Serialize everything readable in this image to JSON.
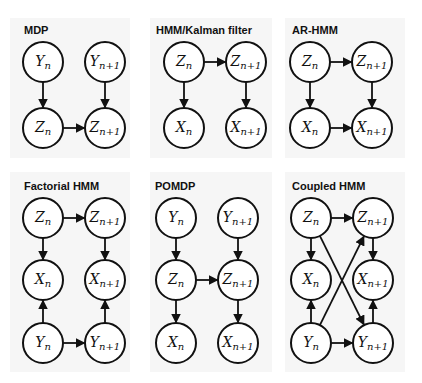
{
  "figure": {
    "panels": [
      {
        "title": "MDP",
        "nodes": [
          {
            "id": "Yn",
            "base": "Y",
            "sub": "n",
            "x": 43,
            "y": 62
          },
          {
            "id": "Yn1",
            "base": "Y",
            "sub": "n+1",
            "x": 105,
            "y": 62
          },
          {
            "id": "Zn",
            "base": "Z",
            "sub": "n",
            "x": 43,
            "y": 128
          },
          {
            "id": "Zn1",
            "base": "Z",
            "sub": "n+1",
            "x": 105,
            "y": 128
          }
        ],
        "edges": [
          [
            "Yn",
            "Zn"
          ],
          [
            "Yn1",
            "Zn1"
          ],
          [
            "Zn",
            "Zn1"
          ]
        ]
      },
      {
        "title": "HMM/Kalman filter",
        "nodes": [
          {
            "id": "Zn",
            "base": "Z",
            "sub": "n",
            "x": 184,
            "y": 62
          },
          {
            "id": "Zn1",
            "base": "Z",
            "sub": "n+1",
            "x": 246,
            "y": 62
          },
          {
            "id": "Xn",
            "base": "X",
            "sub": "n",
            "x": 184,
            "y": 128
          },
          {
            "id": "Xn1",
            "base": "X",
            "sub": "n+1",
            "x": 246,
            "y": 128
          }
        ],
        "edges": [
          [
            "Zn",
            "Zn1"
          ],
          [
            "Zn",
            "Xn"
          ],
          [
            "Zn1",
            "Xn1"
          ]
        ]
      },
      {
        "title": "AR-HMM",
        "nodes": [
          {
            "id": "Zn",
            "base": "Z",
            "sub": "n",
            "x": 310,
            "y": 62
          },
          {
            "id": "Zn1",
            "base": "Z",
            "sub": "n+1",
            "x": 372,
            "y": 62
          },
          {
            "id": "Xn",
            "base": "X",
            "sub": "n",
            "x": 310,
            "y": 128
          },
          {
            "id": "Xn1",
            "base": "X",
            "sub": "n+1",
            "x": 372,
            "y": 128
          }
        ],
        "edges": [
          [
            "Zn",
            "Zn1"
          ],
          [
            "Zn",
            "Xn"
          ],
          [
            "Zn1",
            "Xn1"
          ],
          [
            "Xn",
            "Xn1"
          ]
        ]
      },
      {
        "title": "Factorial HMM",
        "nodes": [
          {
            "id": "Zn",
            "base": "Z",
            "sub": "n",
            "x": 43,
            "y": 218
          },
          {
            "id": "Zn1",
            "base": "Z",
            "sub": "n+1",
            "x": 105,
            "y": 218
          },
          {
            "id": "Xn",
            "base": "X",
            "sub": "n",
            "x": 43,
            "y": 280
          },
          {
            "id": "Xn1",
            "base": "X",
            "sub": "n+1",
            "x": 105,
            "y": 280
          },
          {
            "id": "Yn",
            "base": "Y",
            "sub": "n",
            "x": 43,
            "y": 343
          },
          {
            "id": "Yn1",
            "base": "Y",
            "sub": "n+1",
            "x": 105,
            "y": 343
          }
        ],
        "edges": [
          [
            "Zn",
            "Zn1"
          ],
          [
            "Zn",
            "Xn"
          ],
          [
            "Zn1",
            "Xn1"
          ],
          [
            "Yn",
            "Xn"
          ],
          [
            "Yn1",
            "Xn1"
          ],
          [
            "Yn",
            "Yn1"
          ]
        ]
      },
      {
        "title": "POMDP",
        "nodes": [
          {
            "id": "Yn",
            "base": "Y",
            "sub": "n",
            "x": 176,
            "y": 218
          },
          {
            "id": "Yn1",
            "base": "Y",
            "sub": "n+1",
            "x": 238,
            "y": 218
          },
          {
            "id": "Zn",
            "base": "Z",
            "sub": "n",
            "x": 176,
            "y": 280
          },
          {
            "id": "Zn1",
            "base": "Z",
            "sub": "n+1",
            "x": 238,
            "y": 280
          },
          {
            "id": "Xn",
            "base": "X",
            "sub": "n",
            "x": 176,
            "y": 343
          },
          {
            "id": "Xn1",
            "base": "X",
            "sub": "n+1",
            "x": 238,
            "y": 343
          }
        ],
        "edges": [
          [
            "Yn",
            "Zn"
          ],
          [
            "Yn1",
            "Zn1"
          ],
          [
            "Zn",
            "Zn1"
          ],
          [
            "Zn",
            "Xn"
          ],
          [
            "Zn1",
            "Xn1"
          ]
        ]
      },
      {
        "title": "Coupled HMM",
        "nodes": [
          {
            "id": "Zn",
            "base": "Z",
            "sub": "n",
            "x": 311,
            "y": 218
          },
          {
            "id": "Zn1",
            "base": "Z",
            "sub": "n+1",
            "x": 373,
            "y": 218
          },
          {
            "id": "Xn",
            "base": "X",
            "sub": "n",
            "x": 311,
            "y": 280
          },
          {
            "id": "Xn1",
            "base": "X",
            "sub": "n+1",
            "x": 373,
            "y": 280
          },
          {
            "id": "Yn",
            "base": "Y",
            "sub": "n",
            "x": 311,
            "y": 343
          },
          {
            "id": "Yn1",
            "base": "Y",
            "sub": "n+1",
            "x": 373,
            "y": 343
          }
        ],
        "edges": [
          [
            "Zn",
            "Zn1"
          ],
          [
            "Zn",
            "Xn"
          ],
          [
            "Zn1",
            "Xn1"
          ],
          [
            "Yn",
            "Xn"
          ],
          [
            "Yn1",
            "Xn1"
          ],
          [
            "Yn",
            "Yn1"
          ],
          [
            "Zn",
            "Yn1"
          ],
          [
            "Yn",
            "Zn1"
          ]
        ]
      }
    ]
  },
  "style": {
    "panel_bg": "#f6f6f6",
    "stroke": "#111111",
    "node_fill": "#ffffff",
    "node_radius": 20
  },
  "layout": {
    "panels": [
      {
        "x": 10,
        "y": 18,
        "w": 120,
        "h": 140,
        "title_x": 24,
        "title_y": 24
      },
      {
        "x": 150,
        "y": 18,
        "w": 122,
        "h": 140,
        "title_x": 156,
        "title_y": 24
      },
      {
        "x": 285,
        "y": 18,
        "w": 120,
        "h": 140,
        "title_x": 292,
        "title_y": 24
      },
      {
        "x": 10,
        "y": 172,
        "w": 120,
        "h": 200,
        "title_x": 24,
        "title_y": 180
      },
      {
        "x": 150,
        "y": 172,
        "w": 122,
        "h": 200,
        "title_x": 155,
        "title_y": 180
      },
      {
        "x": 285,
        "y": 172,
        "w": 120,
        "h": 200,
        "title_x": 292,
        "title_y": 180
      }
    ]
  }
}
